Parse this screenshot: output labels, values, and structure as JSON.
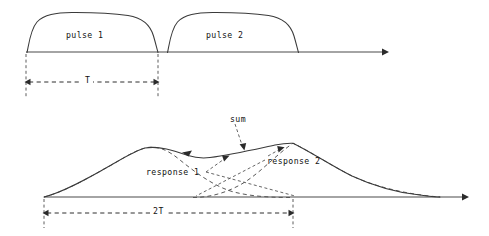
{
  "figure": {
    "width": 489,
    "height": 236,
    "background": "#ffffff",
    "stroke_color": "#3a3a3a",
    "axis_color": "#4a4a4a",
    "text_color": "#111111"
  },
  "top_panel": {
    "axis": {
      "name": "time-axis",
      "y": 52,
      "x_start": 26,
      "x_end": 385,
      "arrow": "right"
    },
    "pulses": [
      {
        "label": "pulse 1",
        "x_start": 28,
        "x_end": 158,
        "top_y": 18,
        "label_x": 66,
        "label_y": 31
      },
      {
        "label": "pulse 2",
        "x_start": 168,
        "x_end": 288,
        "top_y": 18,
        "label_x": 206,
        "label_y": 31
      }
    ],
    "dimension": {
      "label": "T",
      "y": 82,
      "x_start": 26,
      "x_end": 158,
      "label_x": 85,
      "label_y": 76
    }
  },
  "bottom_panel": {
    "axis": {
      "name": "time-axis",
      "y": 197,
      "x_start": 44,
      "x_end": 468,
      "arrow": "right"
    },
    "sum_curve": {
      "label": "sum",
      "label_x": 230,
      "label_y": 115,
      "peak1_x": 145,
      "peak1_y": 148,
      "dip_x": 205,
      "dip_y": 158,
      "peak2_x": 293,
      "peak2_y": 143,
      "x_start": 44,
      "x_end": 440
    },
    "responses": [
      {
        "label": "response 1",
        "label_x": 146,
        "label_y": 168,
        "x_start": 44,
        "peak_x": 145,
        "peak_y": 148,
        "x_end": 293
      },
      {
        "label": "response 2",
        "label_x": 267,
        "label_y": 157,
        "x_start": 193,
        "peak_x": 293,
        "peak_y": 143,
        "x_end": 440
      }
    ],
    "dimension": {
      "label": "2T",
      "y": 213,
      "x_start": 44,
      "x_end": 293,
      "label_x": 155,
      "label_y": 207
    }
  }
}
